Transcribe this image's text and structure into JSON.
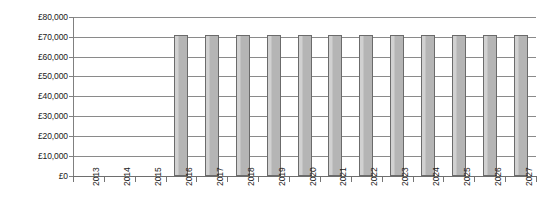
{
  "chart_data": {
    "type": "bar",
    "title": "",
    "subtitle": "",
    "xlabel": "",
    "ylabel": "",
    "categories": [
      "2013",
      "2014",
      "2015",
      "2016",
      "2017",
      "2018",
      "2019",
      "2020",
      "2021",
      "2022",
      "2023",
      "2024",
      "2025",
      "2026",
      "2027"
    ],
    "values": [
      0,
      0,
      0,
      71000,
      71000,
      71000,
      71000,
      71000,
      71000,
      71000,
      71000,
      71000,
      71000,
      71000,
      71000
    ],
    "series": [
      {
        "name": "",
        "values": [
          0,
          0,
          0,
          71000,
          71000,
          71000,
          71000,
          71000,
          71000,
          71000,
          71000,
          71000,
          71000,
          71000,
          71000
        ]
      }
    ],
    "ylim": [
      0,
      80000
    ],
    "ytick_values": [
      0,
      10000,
      20000,
      30000,
      40000,
      50000,
      60000,
      70000,
      80000
    ],
    "ytick_labels": [
      "£0",
      "£10,000",
      "£20,000",
      "£30,000",
      "£40,000",
      "£50,000",
      "£60,000",
      "£70,000",
      "£80,000"
    ],
    "xtick_labels": [
      "2013",
      "2014",
      "2015",
      "2016",
      "2017",
      "2018",
      "2019",
      "2020",
      "2021",
      "2022",
      "2023",
      "2024",
      "2025",
      "2026",
      "2027"
    ],
    "grid": true,
    "grid_axis": "y",
    "legend": false,
    "legend_position": "none",
    "annotations": [],
    "currency_symbol": "£",
    "bar_color": "#b5b5b5",
    "bar_border_color": "#6b6b6b",
    "gridline_color": "#8a8a8a",
    "axis_color": "#6e6e6e",
    "text_color": "#1a1a1a",
    "background_color": "#ffffff",
    "xlabel_rotation": -90
  }
}
